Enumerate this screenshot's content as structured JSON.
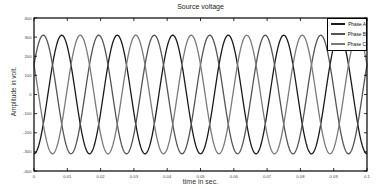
{
  "chart_data": {
    "type": "line",
    "title": "Source voltage",
    "xlabel": "time in sec.",
    "ylabel": "Amplitude in volt.",
    "xlim": [
      0,
      0.1
    ],
    "ylim": [
      -400,
      400
    ],
    "xticks": [
      "0",
      "0.01",
      "0.02",
      "0.03",
      "0.04",
      "0.05",
      "0.06",
      "0.07",
      "0.08",
      "0.09",
      "0.1"
    ],
    "yticks": [
      "400",
      "300",
      "200",
      "100",
      "0",
      "-100",
      "-200",
      "-300",
      "-400"
    ],
    "grid": false,
    "legend_position": "upper right",
    "series": [
      {
        "name": "Phase A",
        "amplitude": 310,
        "frequency_hz": 60,
        "phase_deg": -90,
        "color": "#1a1a1a"
      },
      {
        "name": "Phase B",
        "amplitude": 310,
        "frequency_hz": 60,
        "phase_deg": 30,
        "color": "#555555"
      },
      {
        "name": "Phase C",
        "amplitude": 310,
        "frequency_hz": 60,
        "phase_deg": 150,
        "color": "#7a7a7a"
      }
    ]
  },
  "legend": {
    "items": [
      {
        "label": "Phase A",
        "color": "#1a1a1a"
      },
      {
        "label": "Phase B",
        "color": "#555555"
      },
      {
        "label": "Phase C",
        "color": "#7a7a7a"
      }
    ]
  }
}
